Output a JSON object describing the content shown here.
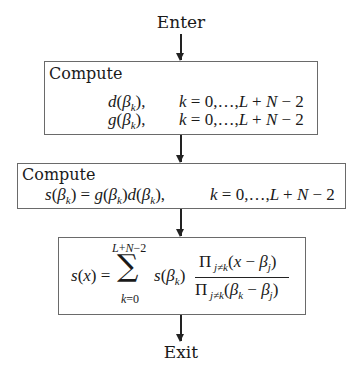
{
  "flowchart": {
    "start": "Enter",
    "end": "Exit",
    "steps": [
      {
        "title": "Compute",
        "lines": [
          {
            "expr": "d(βk),",
            "range": "k = 0,…,L + N − 2"
          },
          {
            "expr": "g(βk),",
            "range": "k = 0,…,L + N − 2"
          }
        ]
      },
      {
        "title": "Compute",
        "lines": [
          {
            "expr": "s(βk) = g(βk)d(βk),",
            "range": "k = 0,…,L + N − 2"
          }
        ]
      },
      {
        "title": "",
        "formula": {
          "lhs": "s(x) =",
          "sum_upper": "L+N−2",
          "sum_lower": "k=0",
          "term": "s(βk)",
          "numerator": "Π j≠k (x − βj)",
          "denominator": "Π j≠k (βk − βj)"
        }
      }
    ],
    "edges": [
      "Enter→Step1",
      "Step1→Step2",
      "Step2→Step3",
      "Step3→Exit"
    ]
  }
}
